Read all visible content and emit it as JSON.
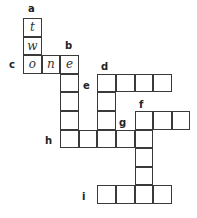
{
  "grid": {
    "origin_x": 23,
    "origin_y": 18,
    "cell_size": 18.6
  },
  "cells": [
    {
      "row": 0,
      "col": 0,
      "letter": "t"
    },
    {
      "row": 1,
      "col": 0,
      "letter": "w"
    },
    {
      "row": 2,
      "col": 0,
      "letter": "o"
    },
    {
      "row": 2,
      "col": 1,
      "letter": "n"
    },
    {
      "row": 2,
      "col": 2,
      "letter": "e"
    },
    {
      "row": 3,
      "col": 2,
      "letter": ""
    },
    {
      "row": 4,
      "col": 2,
      "letter": ""
    },
    {
      "row": 5,
      "col": 2,
      "letter": ""
    },
    {
      "row": 6,
      "col": 2,
      "letter": ""
    },
    {
      "row": 3,
      "col": 4,
      "letter": ""
    },
    {
      "row": 3,
      "col": 5,
      "letter": ""
    },
    {
      "row": 3,
      "col": 6,
      "letter": ""
    },
    {
      "row": 3,
      "col": 7,
      "letter": ""
    },
    {
      "row": 4,
      "col": 4,
      "letter": ""
    },
    {
      "row": 5,
      "col": 4,
      "letter": ""
    },
    {
      "row": 6,
      "col": 4,
      "letter": ""
    },
    {
      "row": 6,
      "col": 3,
      "letter": ""
    },
    {
      "row": 6,
      "col": 5,
      "letter": ""
    },
    {
      "row": 6,
      "col": 6,
      "letter": ""
    },
    {
      "row": 5,
      "col": 6,
      "letter": ""
    },
    {
      "row": 5,
      "col": 7,
      "letter": ""
    },
    {
      "row": 5,
      "col": 8,
      "letter": ""
    },
    {
      "row": 7,
      "col": 6,
      "letter": ""
    },
    {
      "row": 8,
      "col": 6,
      "letter": ""
    },
    {
      "row": 9,
      "col": 4,
      "letter": ""
    },
    {
      "row": 9,
      "col": 5,
      "letter": ""
    },
    {
      "row": 9,
      "col": 6,
      "letter": ""
    },
    {
      "row": 9,
      "col": 7,
      "letter": ""
    }
  ],
  "labels": [
    {
      "text": "a",
      "x": 28,
      "y": 4
    },
    {
      "text": "b",
      "x": 65,
      "y": 41
    },
    {
      "text": "c",
      "x": 9,
      "y": 60
    },
    {
      "text": "d",
      "x": 101,
      "y": 62
    },
    {
      "text": "e",
      "x": 83,
      "y": 81
    },
    {
      "text": "f",
      "x": 139,
      "y": 100
    },
    {
      "text": "g",
      "x": 119,
      "y": 118
    },
    {
      "text": "h",
      "x": 45,
      "y": 136
    },
    {
      "text": "i",
      "x": 82,
      "y": 192
    }
  ]
}
